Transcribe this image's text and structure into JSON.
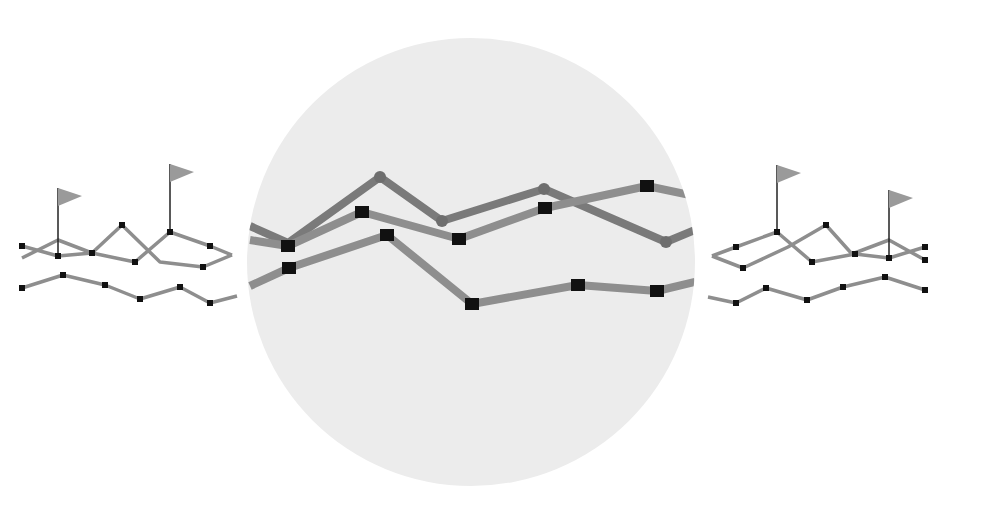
{
  "colors": {
    "background": "#ffffff",
    "magnifier_fill": "#ececec",
    "line": "#8e8e8e",
    "line_dark": "#7a7a7a",
    "marker": "#111111",
    "circle_marker": "#6e6e6e",
    "flag": "#9a9a9a",
    "pole": "#222222"
  },
  "magnifier": {
    "cx": 471,
    "cy": 262,
    "r": 224
  },
  "center_lines": [
    {
      "name": "upper-line",
      "marker": "circle",
      "points": [
        [
          250,
          226
        ],
        [
          288,
          243
        ],
        [
          380,
          177
        ],
        [
          442,
          221
        ],
        [
          544,
          189
        ],
        [
          666,
          242
        ],
        [
          695,
          230
        ]
      ],
      "markers": [
        [
          380,
          177
        ],
        [
          442,
          221
        ],
        [
          544,
          189
        ],
        [
          666,
          242
        ]
      ]
    },
    {
      "name": "middle-line",
      "marker": "square",
      "points": [
        [
          250,
          240
        ],
        [
          288,
          246
        ],
        [
          362,
          212
        ],
        [
          459,
          239
        ],
        [
          545,
          208
        ],
        [
          647,
          186
        ],
        [
          695,
          196
        ]
      ],
      "markers": [
        [
          288,
          246
        ],
        [
          362,
          212
        ],
        [
          459,
          239
        ],
        [
          545,
          208
        ],
        [
          647,
          186
        ]
      ]
    },
    {
      "name": "lower-line",
      "marker": "square",
      "points": [
        [
          250,
          286
        ],
        [
          289,
          268
        ],
        [
          387,
          235
        ],
        [
          472,
          304
        ],
        [
          578,
          285
        ],
        [
          657,
          291
        ],
        [
          695,
          282
        ]
      ],
      "markers": [
        [
          289,
          268
        ],
        [
          387,
          235
        ],
        [
          472,
          304
        ],
        [
          578,
          285
        ],
        [
          657,
          291
        ]
      ]
    }
  ],
  "left_mini": {
    "lines": [
      {
        "points": [
          [
            22,
            246
          ],
          [
            58,
            256
          ],
          [
            92,
            253
          ],
          [
            135,
            262
          ],
          [
            170,
            232
          ],
          [
            210,
            246
          ],
          [
            232,
            255
          ]
        ],
        "markers": [
          [
            22,
            246
          ],
          [
            58,
            256
          ],
          [
            92,
            253
          ],
          [
            135,
            262
          ],
          [
            170,
            232
          ],
          [
            210,
            246
          ]
        ]
      },
      {
        "points": [
          [
            22,
            258
          ],
          [
            58,
            240
          ],
          [
            92,
            253
          ],
          [
            122,
            225
          ],
          [
            160,
            262
          ],
          [
            203,
            267
          ],
          [
            232,
            255
          ]
        ],
        "markers": [
          [
            122,
            225
          ],
          [
            203,
            267
          ]
        ]
      },
      {
        "points": [
          [
            22,
            288
          ],
          [
            63,
            275
          ],
          [
            105,
            285
          ],
          [
            140,
            299
          ],
          [
            180,
            287
          ],
          [
            210,
            303
          ],
          [
            237,
            296
          ]
        ],
        "markers": [
          [
            22,
            288
          ],
          [
            63,
            275
          ],
          [
            105,
            285
          ],
          [
            140,
            299
          ],
          [
            180,
            287
          ],
          [
            210,
            303
          ]
        ]
      }
    ],
    "flags": [
      {
        "x": 58,
        "base": 256,
        "top": 188
      },
      {
        "x": 170,
        "base": 232,
        "top": 164
      }
    ]
  },
  "right_mini": {
    "lines": [
      {
        "points": [
          [
            712,
            256
          ],
          [
            736,
            247
          ],
          [
            777,
            232
          ],
          [
            812,
            262
          ],
          [
            855,
            254
          ],
          [
            889,
            258
          ],
          [
            925,
            247
          ]
        ],
        "markers": [
          [
            736,
            247
          ],
          [
            777,
            232
          ],
          [
            812,
            262
          ],
          [
            855,
            254
          ],
          [
            889,
            258
          ],
          [
            925,
            247
          ]
        ]
      },
      {
        "points": [
          [
            712,
            256
          ],
          [
            743,
            268
          ],
          [
            788,
            247
          ],
          [
            826,
            225
          ],
          [
            852,
            254
          ],
          [
            889,
            240
          ],
          [
            925,
            260
          ]
        ],
        "markers": [
          [
            743,
            268
          ],
          [
            826,
            225
          ],
          [
            925,
            260
          ]
        ]
      },
      {
        "points": [
          [
            708,
            297
          ],
          [
            736,
            303
          ],
          [
            766,
            288
          ],
          [
            807,
            300
          ],
          [
            843,
            287
          ],
          [
            885,
            277
          ],
          [
            925,
            290
          ]
        ],
        "markers": [
          [
            736,
            303
          ],
          [
            766,
            288
          ],
          [
            807,
            300
          ],
          [
            843,
            287
          ],
          [
            885,
            277
          ],
          [
            925,
            290
          ]
        ]
      }
    ],
    "flags": [
      {
        "x": 777,
        "base": 232,
        "top": 165
      },
      {
        "x": 889,
        "base": 258,
        "top": 190
      }
    ]
  }
}
